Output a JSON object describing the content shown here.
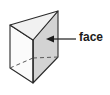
{
  "figure": {
    "name": "triangular-prism-with-face-label",
    "shape_type": "triangular prism",
    "background_color": "#ffffff",
    "annotation": {
      "label_text": "face",
      "label_color": "#1b1b1b",
      "pointer": "arrow pointing left from label to the right rectangular face",
      "arrow_tip_x": 47,
      "arrow_tip_y": 39,
      "leader_end_x": 76,
      "leader_end_y": 39
    },
    "solid": {
      "outline_color": "#2b2b2b",
      "hidden_edge_style": "dashed",
      "faces": [
        {
          "name": "top-triangular-face",
          "fill": "#f2f2f2",
          "visible": true
        },
        {
          "name": "left-rectangular-face",
          "fill": "#fafafa",
          "visible": true
        },
        {
          "name": "right-rectangular-face",
          "fill": "#d6d6d6",
          "visible": true
        },
        {
          "name": "back-rectangular-face",
          "fill": "none",
          "visible": false
        },
        {
          "name": "bottom-triangular-face",
          "fill": "none",
          "visible": false
        }
      ],
      "vertices": {
        "top_left": [
          10,
          25
        ],
        "top_front": [
          33,
          40
        ],
        "top_right": [
          58,
          11
        ],
        "bottom_left": [
          10,
          68
        ],
        "bottom_front": [
          33,
          83
        ],
        "bottom_right": [
          58,
          57
        ],
        "hidden_back": [
          33,
          58
        ]
      }
    }
  }
}
